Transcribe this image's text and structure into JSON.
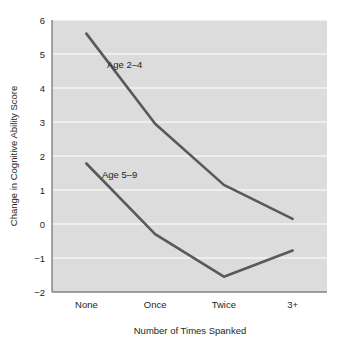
{
  "chart_data": {
    "type": "line",
    "title": "",
    "xlabel": "Number of Times Spanked",
    "ylabel": "Change in Cognitive Ability Score",
    "categories": [
      "None",
      "Once",
      "Twice",
      "3+"
    ],
    "series": [
      {
        "name": "Age 2–4",
        "values": [
          5.6,
          2.95,
          1.15,
          0.15
        ],
        "color": "#595959",
        "label_text": "Age 2–4"
      },
      {
        "name": "Age 5–9",
        "values": [
          1.78,
          -0.3,
          -1.55,
          -0.78
        ],
        "color": "#595959",
        "label_text": "Age 5–9"
      }
    ],
    "ylim": [
      -2,
      6
    ],
    "yticks": [
      -2,
      -1,
      0,
      1,
      2,
      3,
      4,
      5,
      6
    ],
    "ytick_labels": [
      "−2",
      "−1",
      "0",
      "1",
      "2",
      "3",
      "4",
      "5",
      "6"
    ],
    "grid": true,
    "grid_axis": "y",
    "grid_color": "#ffffff",
    "plot_background": "#dcdcdc",
    "axis_color": "#808080",
    "legend_position": "inline-labels"
  },
  "axes": {
    "y_title": "Change in Cognitive Ability Score",
    "x_title": "Number of Times Spanked",
    "y_ticks": [
      {
        "value": 6,
        "label": "6"
      },
      {
        "value": 5,
        "label": "5"
      },
      {
        "value": 4,
        "label": "4"
      },
      {
        "value": 3,
        "label": "3"
      },
      {
        "value": 2,
        "label": "2"
      },
      {
        "value": 1,
        "label": "1"
      },
      {
        "value": 0,
        "label": "0"
      },
      {
        "value": -1,
        "label": "−1"
      },
      {
        "value": -2,
        "label": "−2"
      }
    ],
    "x_ticks": [
      {
        "index": 0,
        "label": "None"
      },
      {
        "index": 1,
        "label": "Once"
      },
      {
        "index": 2,
        "label": "Twice"
      },
      {
        "index": 3,
        "label": "3+"
      }
    ]
  },
  "annotations": [
    {
      "id": "age-2-4",
      "text": "Age 2–4"
    },
    {
      "id": "age-5-9",
      "text": "Age 5–9"
    }
  ]
}
